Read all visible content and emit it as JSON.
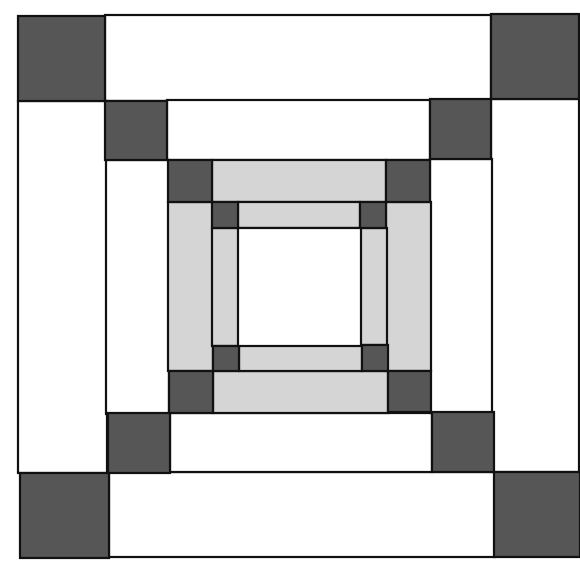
{
  "diagram": {
    "title": "",
    "type": "quilt-block-concentric-squares",
    "colors": {
      "dark": "#565656",
      "light": "#d5d5d5",
      "white": "#ffffff",
      "line": "#111111"
    },
    "pieces": [
      {
        "name": "ring1-top-bar",
        "x": 105,
        "y": 15,
        "w": 386,
        "h": 86,
        "fill": "white"
      },
      {
        "name": "ring1-bottom-bar",
        "x": 109,
        "y": 472,
        "w": 386,
        "h": 85,
        "fill": "white"
      },
      {
        "name": "ring1-left-bar",
        "x": 18,
        "y": 101,
        "w": 89,
        "h": 372,
        "fill": "white"
      },
      {
        "name": "ring1-right-bar",
        "x": 491,
        "y": 99,
        "w": 88,
        "h": 373,
        "fill": "white"
      },
      {
        "name": "ring1-corner-tl",
        "x": 18,
        "y": 16,
        "w": 87,
        "h": 85,
        "fill": "dark"
      },
      {
        "name": "ring1-corner-tr",
        "x": 491,
        "y": 14,
        "w": 88,
        "h": 85,
        "fill": "dark"
      },
      {
        "name": "ring1-corner-bl",
        "x": 20,
        "y": 473,
        "w": 89,
        "h": 85,
        "fill": "dark"
      },
      {
        "name": "ring1-corner-br",
        "x": 494,
        "y": 472,
        "w": 86,
        "h": 85,
        "fill": "dark"
      },
      {
        "name": "ring2-top-bar",
        "x": 167,
        "y": 100,
        "w": 263,
        "h": 60,
        "fill": "white"
      },
      {
        "name": "ring2-bottom-bar",
        "x": 170,
        "y": 413,
        "w": 262,
        "h": 59,
        "fill": "white"
      },
      {
        "name": "ring2-left-bar",
        "x": 106,
        "y": 160,
        "w": 63,
        "h": 254,
        "fill": "white"
      },
      {
        "name": "ring2-right-bar",
        "x": 430,
        "y": 159,
        "w": 62,
        "h": 254,
        "fill": "white"
      },
      {
        "name": "ring2-corner-tl",
        "x": 105,
        "y": 101,
        "w": 62,
        "h": 59,
        "fill": "dark"
      },
      {
        "name": "ring2-corner-tr",
        "x": 430,
        "y": 99,
        "w": 61,
        "h": 60,
        "fill": "dark"
      },
      {
        "name": "ring2-corner-bl",
        "x": 108,
        "y": 413,
        "w": 62,
        "h": 60,
        "fill": "dark"
      },
      {
        "name": "ring2-corner-br",
        "x": 432,
        "y": 412,
        "w": 62,
        "h": 60,
        "fill": "dark"
      },
      {
        "name": "ring3-top-bar",
        "x": 212,
        "y": 160,
        "w": 174,
        "h": 42,
        "fill": "light"
      },
      {
        "name": "ring3-bottom-bar",
        "x": 213,
        "y": 371,
        "w": 175,
        "h": 42,
        "fill": "light"
      },
      {
        "name": "ring3-left-bar",
        "x": 168,
        "y": 202,
        "w": 45,
        "h": 169,
        "fill": "light"
      },
      {
        "name": "ring3-right-bar",
        "x": 386,
        "y": 202,
        "w": 45,
        "h": 169,
        "fill": "light"
      },
      {
        "name": "ring3-corner-tl",
        "x": 168,
        "y": 160,
        "w": 44,
        "h": 42,
        "fill": "dark"
      },
      {
        "name": "ring3-corner-tr",
        "x": 386,
        "y": 160,
        "w": 44,
        "h": 42,
        "fill": "dark"
      },
      {
        "name": "ring3-corner-bl",
        "x": 169,
        "y": 371,
        "w": 44,
        "h": 42,
        "fill": "dark"
      },
      {
        "name": "ring3-corner-br",
        "x": 388,
        "y": 371,
        "w": 43,
        "h": 41,
        "fill": "dark"
      },
      {
        "name": "ring4-top-bar",
        "x": 238,
        "y": 202,
        "w": 122,
        "h": 26,
        "fill": "light"
      },
      {
        "name": "ring4-bottom-bar",
        "x": 239,
        "y": 345,
        "w": 123,
        "h": 26,
        "fill": "light"
      },
      {
        "name": "ring4-left-bar",
        "x": 212,
        "y": 228,
        "w": 27,
        "h": 118,
        "fill": "light"
      },
      {
        "name": "ring4-right-bar",
        "x": 360,
        "y": 228,
        "w": 27,
        "h": 117,
        "fill": "light"
      },
      {
        "name": "ring4-corner-tl",
        "x": 212,
        "y": 202,
        "w": 26,
        "h": 26,
        "fill": "dark"
      },
      {
        "name": "ring4-corner-tr",
        "x": 360,
        "y": 202,
        "w": 26,
        "h": 26,
        "fill": "dark"
      },
      {
        "name": "ring4-corner-bl",
        "x": 213,
        "y": 346,
        "w": 26,
        "h": 25,
        "fill": "dark"
      },
      {
        "name": "ring4-corner-br",
        "x": 362,
        "y": 345,
        "w": 26,
        "h": 26,
        "fill": "dark"
      },
      {
        "name": "center-square",
        "x": 238,
        "y": 228,
        "w": 123,
        "h": 118,
        "fill": "white"
      }
    ]
  }
}
